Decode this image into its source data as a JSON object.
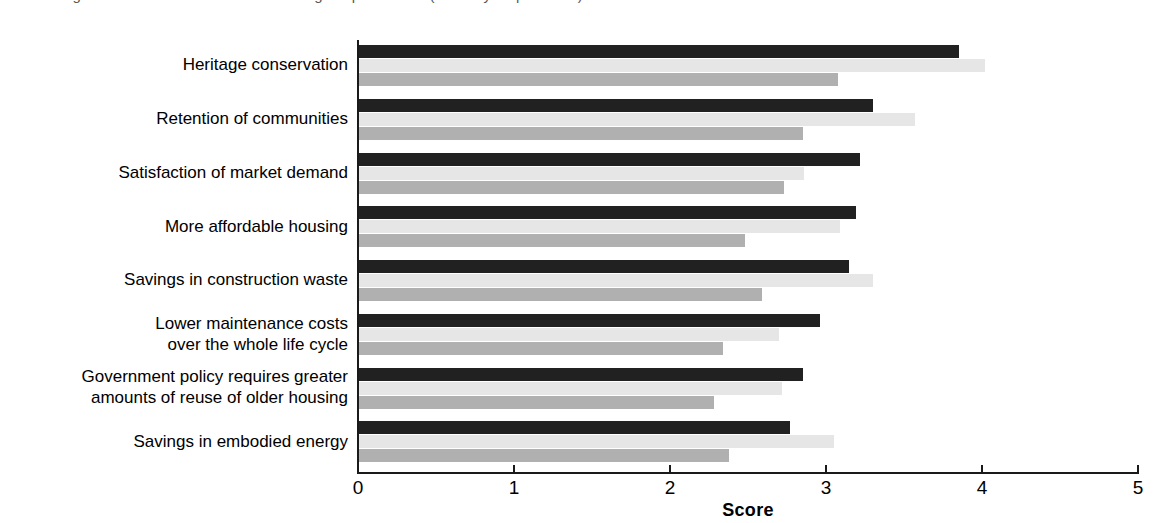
{
  "caption": {
    "text": "Figure 4. Benefits of residential building adaptive reuse (score by respondents)"
  },
  "chart_data": {
    "type": "bar",
    "orientation": "horizontal",
    "title": "",
    "xlabel": "Score",
    "ylabel": "",
    "xlim": [
      0,
      5
    ],
    "xticks": [
      "0",
      "1",
      "2",
      "3",
      "4",
      "5"
    ],
    "grid": false,
    "legend": "none",
    "categories": [
      "Heritage conservation",
      "Retention of communities",
      "Satisfaction of market demand",
      "More affordable housing",
      "Savings in construction waste",
      "Lower maintenance costs\nover the whole life cycle",
      "Government policy requires greater\namounts of reuse of older housing",
      "Savings in embodied energy"
    ],
    "category_lines": [
      [
        "Heritage conservation"
      ],
      [
        "Retention of communities"
      ],
      [
        "Satisfaction of market demand"
      ],
      [
        "More affordable housing"
      ],
      [
        "Savings in construction waste"
      ],
      [
        "Lower maintenance costs",
        "over the whole life cycle"
      ],
      [
        "Government policy requires greater",
        "amounts of reuse of older housing"
      ],
      [
        "Savings in embodied energy"
      ]
    ],
    "series": [
      {
        "name": "Series 1",
        "color": "#212121",
        "values": [
          3.85,
          3.3,
          3.22,
          3.19,
          3.15,
          2.96,
          2.85,
          2.77
        ]
      },
      {
        "name": "Series 2",
        "color": "#e6e6e6",
        "values": [
          4.02,
          3.57,
          2.86,
          3.09,
          3.3,
          2.7,
          2.72,
          3.05
        ]
      },
      {
        "name": "Series 3",
        "color": "#b0b0b0",
        "values": [
          3.08,
          2.85,
          2.73,
          2.48,
          2.59,
          2.34,
          2.28,
          2.38
        ]
      }
    ],
    "colors": {
      "series_dark": "#212121",
      "series_light": "#e6e6e6",
      "series_mid": "#b0b0b0",
      "axis": "#1a1a1a",
      "background": "#ffffff"
    }
  }
}
